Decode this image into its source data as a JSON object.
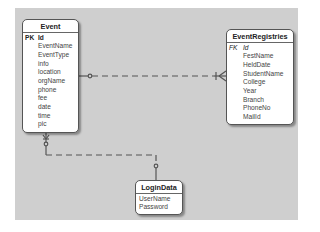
{
  "diagram": {
    "type": "entity-relationship",
    "entities": [
      {
        "id": "Event",
        "title": "Event",
        "pk_label": "PK",
        "fields": [
          "Id",
          "EventName",
          "EventType",
          "info",
          "location",
          "orgName",
          "phone",
          "fee",
          "date",
          "time",
          "pic"
        ]
      },
      {
        "id": "EventRegistries",
        "title": "EventRegistries",
        "pk_label": "FK",
        "fields": [
          "Id",
          "FestName",
          "HeldDate",
          "StudentName",
          "College",
          "Year",
          "Branch",
          "PhoneNo",
          "MailId"
        ]
      },
      {
        "id": "LoginData",
        "title": "LoginData",
        "fields": [
          "UserName",
          "Password"
        ]
      }
    ],
    "relationships": [
      {
        "from": "Event",
        "to": "EventRegistries",
        "from_cardinality": "zero-or-one",
        "to_cardinality": "one-or-many",
        "style": "dashed"
      },
      {
        "from": "LoginData",
        "to": "Event",
        "from_cardinality": "zero-or-one",
        "to_cardinality": "zero-or-many",
        "style": "dashed"
      }
    ],
    "colors": {
      "canvas": "#cfcfcf",
      "entity_fill": "#ffffff",
      "border": "#555555",
      "line": "#555555"
    }
  }
}
